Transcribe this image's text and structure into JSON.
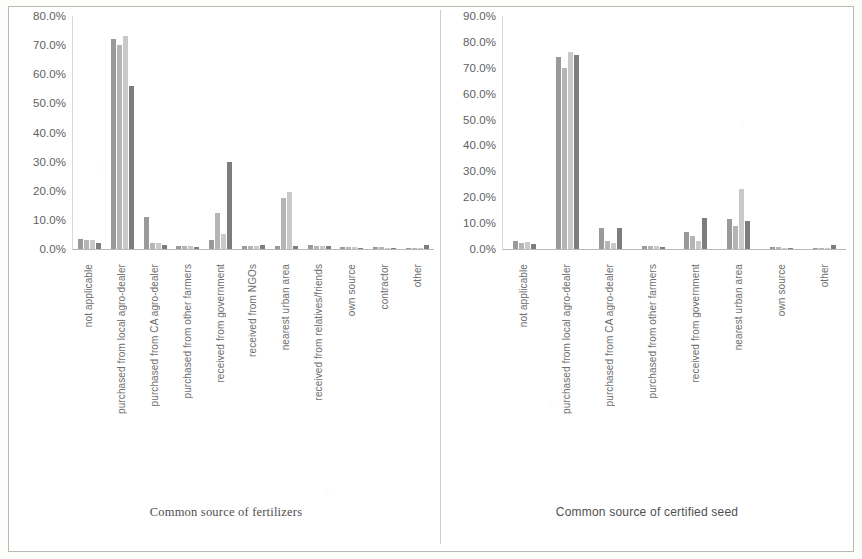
{
  "document": {
    "type": "scanned-figure",
    "background_color": "#ffffff",
    "border_color": "#b9b9b4"
  },
  "chart_data": [
    {
      "id": "fertilizers",
      "type": "bar",
      "title": "",
      "xlabel": "Common source of fertilizers",
      "ylabel": "",
      "ylim": [
        0,
        80
      ],
      "grid": false,
      "legend": "none",
      "ytick_labels": [
        "80.0%",
        "70.0%",
        "60.0%",
        "50.0%",
        "40.0%",
        "30.0%",
        "20.0%",
        "10.0%",
        "0.0%"
      ],
      "ytick_values": [
        80,
        70,
        60,
        50,
        40,
        30,
        20,
        10,
        0
      ],
      "categories": [
        "not applicable",
        "purchased from local agro-dealer",
        "purchased from CA agro-dealer",
        "purchased from other farmers",
        "received from government",
        "received from NGOs",
        "nearest urban area",
        "received from relatives/friends",
        "own source",
        "contractor",
        "other"
      ],
      "series": [
        {
          "name": "Series 1",
          "color": "#9a9a9a",
          "values": [
            3.5,
            72.0,
            11.0,
            1.0,
            3.0,
            1.0,
            1.0,
            1.5,
            0.8,
            0.6,
            0.5
          ]
        },
        {
          "name": "Series 2",
          "color": "#b5b5b5",
          "values": [
            3.0,
            70.0,
            2.0,
            1.0,
            12.5,
            1.0,
            17.5,
            1.2,
            0.8,
            0.6,
            0.5
          ]
        },
        {
          "name": "Series 3",
          "color": "#c9c9c9",
          "values": [
            3.2,
            73.0,
            2.0,
            1.0,
            5.0,
            1.0,
            19.5,
            1.0,
            0.6,
            0.4,
            0.4
          ]
        },
        {
          "name": "Series 4",
          "color": "#7d7d7d",
          "values": [
            2.0,
            56.0,
            1.5,
            0.8,
            30.0,
            1.5,
            1.0,
            1.0,
            0.5,
            0.4,
            1.5
          ]
        }
      ]
    },
    {
      "id": "certified-seed",
      "type": "bar",
      "title": "",
      "xlabel": "Common source of certified seed",
      "ylabel": "",
      "ylim": [
        0,
        90
      ],
      "grid": false,
      "legend": "none",
      "ytick_labels": [
        "90.0%",
        "80.0%",
        "70.0%",
        "60.0%",
        "50.0%",
        "40.0%",
        "30.0%",
        "20.0%",
        "10.0%",
        "0.0%"
      ],
      "ytick_values": [
        90,
        80,
        70,
        60,
        50,
        40,
        30,
        20,
        10,
        0
      ],
      "categories": [
        "not applicable",
        "purchased from local agro-dealer",
        "purchased from CA agro-dealer",
        "purchased from other farmers",
        "received from government",
        "nearest urban area",
        "own source",
        "other"
      ],
      "series": [
        {
          "name": "Series 1",
          "color": "#9a9a9a",
          "values": [
            3.0,
            74.0,
            8.0,
            1.0,
            6.5,
            11.5,
            0.6,
            0.5
          ]
        },
        {
          "name": "Series 2",
          "color": "#b5b5b5",
          "values": [
            2.5,
            70.0,
            3.0,
            1.0,
            5.0,
            9.0,
            0.6,
            0.5
          ]
        },
        {
          "name": "Series 3",
          "color": "#c9c9c9",
          "values": [
            2.8,
            76.0,
            2.5,
            1.0,
            3.0,
            23.0,
            0.5,
            0.5
          ]
        },
        {
          "name": "Series 4",
          "color": "#7d7d7d",
          "values": [
            2.0,
            75.0,
            8.0,
            0.8,
            12.0,
            11.0,
            0.4,
            1.5
          ]
        }
      ]
    }
  ]
}
